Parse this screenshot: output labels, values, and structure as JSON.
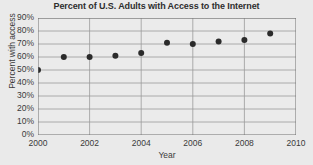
{
  "chart_data": {
    "type": "scatter",
    "title": "Percent of U.S. Adults with Access to the Internet",
    "xlabel": "Year",
    "ylabel": "Percent with access",
    "x": [
      2000,
      2001,
      2002,
      2003,
      2004,
      2005,
      2006,
      2007,
      2008,
      2009
    ],
    "values": [
      50,
      60,
      60,
      61,
      63,
      71,
      70,
      72,
      73,
      78
    ],
    "point_labels": [
      "50%",
      "60%",
      "60%",
      "61%",
      "63%",
      "71%",
      "70%",
      "72%",
      "73%",
      "78%"
    ],
    "xlim": [
      2000,
      2010
    ],
    "ylim": [
      0,
      90
    ],
    "xticks": [
      2000,
      2002,
      2004,
      2006,
      2008,
      2010
    ],
    "xtick_labels": [
      "2000",
      "2002",
      "2004",
      "2006",
      "2008",
      "2010"
    ],
    "yticks": [
      0,
      10,
      20,
      30,
      40,
      50,
      60,
      70,
      80,
      90
    ],
    "ytick_labels": [
      "0%",
      "10%",
      "20%",
      "30%",
      "40%",
      "50%",
      "60%",
      "70%",
      "80%",
      "90%"
    ],
    "grid": true,
    "grid_axis": "both",
    "legend": false,
    "marker_color": "#2b2b2b",
    "grid_color": "#9a9a9a",
    "axis_color": "#5a5a5a",
    "background_color": "#eaeaea",
    "plot_background_color": "#ebebeb"
  }
}
